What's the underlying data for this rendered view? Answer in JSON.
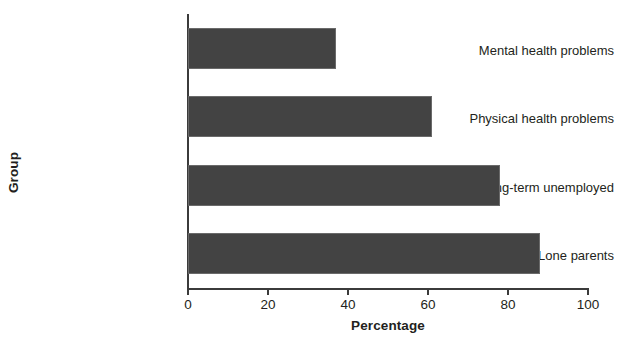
{
  "chart_data": {
    "type": "bar",
    "orientation": "horizontal",
    "title": "",
    "xlabel": "Percentage",
    "ylabel": "Group",
    "categories": [
      "Mental health problems",
      "Physical health problems",
      "Long-term unemployed",
      "Lone parents"
    ],
    "values": [
      37,
      61,
      78,
      88
    ],
    "xlim": [
      0,
      100
    ],
    "xticks": [
      0,
      20,
      40,
      60,
      80,
      100
    ],
    "xtick_labels": [
      "0",
      "20",
      "40",
      "60",
      "80",
      "100"
    ],
    "grid": false,
    "legend": null,
    "bar_color": "#434343",
    "axis_color": "#3b3b3b",
    "background_color": "#ffffff",
    "text_color": "#231f20"
  }
}
